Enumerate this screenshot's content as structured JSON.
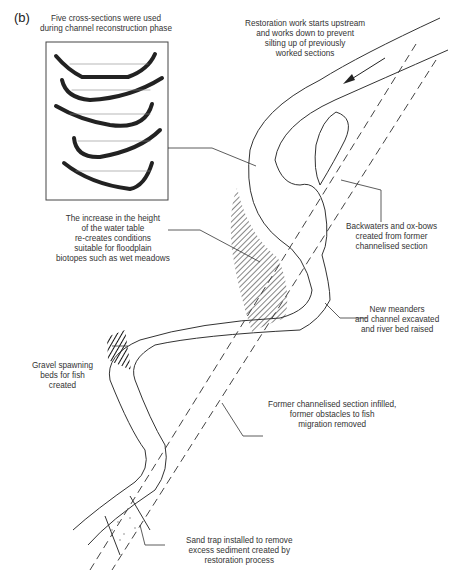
{
  "figure": {
    "panel_label": "(b)",
    "labels": {
      "cross_sections": [
        "Five cross-sections were used",
        "during channel reconstruction phase"
      ],
      "restoration_work": [
        "Restoration work starts upstream",
        "and works down to prevent",
        "silting up of previously",
        "worked sections"
      ],
      "water_table": [
        "The increase in the height",
        "of the water table",
        "re-creates conditions",
        "suitable for floodplain",
        "biotopes such as wet meadows"
      ],
      "backwaters": [
        "Backwaters and ox-bows",
        "created from former",
        "channelised section"
      ],
      "new_meanders": [
        "New meanders",
        "and channel excavated",
        "and river bed raised"
      ],
      "gravel": [
        "Gravel spawning",
        "beds for fish",
        "created"
      ],
      "former_channel": [
        "Former channelised section infilled,",
        "former obstacles to fish",
        "migration removed"
      ],
      "sand_trap": [
        "Sand trap installed to remove",
        "excess sediment created by",
        "restoration process"
      ]
    },
    "colors": {
      "ink": "#2a2a2a",
      "background": "#ffffff"
    }
  }
}
